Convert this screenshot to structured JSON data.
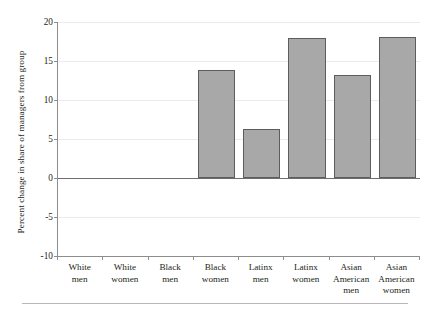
{
  "chart_data": {
    "type": "bar",
    "title": "",
    "subtitle": "",
    "xlabel": "",
    "ylabel": "Percent change in share of managers from group",
    "categories": [
      "White men",
      "White women",
      "Black men",
      "Black women",
      "Latinx men",
      "Latinx women",
      "Asian American men",
      "Asian American women"
    ],
    "category_lines": [
      [
        "White",
        "men"
      ],
      [
        "White",
        "women"
      ],
      [
        "Black",
        "men"
      ],
      [
        "Black",
        "women"
      ],
      [
        "Latinx",
        "men"
      ],
      [
        "Latinx",
        "women"
      ],
      [
        "Asian",
        "American",
        "men"
      ],
      [
        "Asian",
        "American",
        "women"
      ]
    ],
    "values": [
      0,
      0,
      0,
      13.8,
      6.3,
      17.9,
      13.2,
      18.1
    ],
    "ylim": [
      -10,
      20
    ],
    "yticks": [
      20,
      15,
      10,
      5,
      0,
      -5,
      -10
    ],
    "ytick_labels": [
      "20",
      "15",
      "10",
      "5",
      "0",
      "-5",
      "-10"
    ],
    "grid": true,
    "grid_axis": "y",
    "legend": null,
    "legend_position": "none",
    "bar_fill_color": "#a8a8a8",
    "bar_edge_color": "#5d5d5d",
    "zero_line_color": "#6e6e6e",
    "gridline_color": "#eceaea",
    "axis_color": "#8d8d8d",
    "background_color": "#ffffff"
  }
}
